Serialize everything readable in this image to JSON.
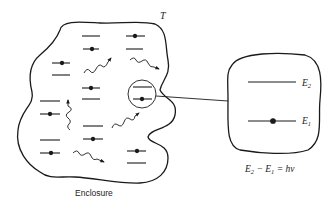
{
  "labels": {
    "temperature": "T",
    "enclosure": "Enclosure",
    "e2": "E",
    "e2_sub": "2",
    "e1": "E",
    "e1_sub": "1",
    "equation": {
      "a": "E",
      "a_sub": "2",
      "minus": " − ",
      "b": "E",
      "b_sub": "1",
      "eq": " = ",
      "rhs": "hν"
    }
  },
  "colors": {
    "stroke": "#1a1a1a",
    "background": "#ffffff"
  }
}
